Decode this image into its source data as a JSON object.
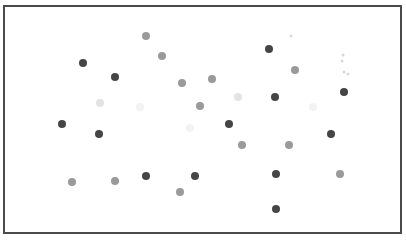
{
  "board": {
    "border_color": "#4a4a4a",
    "background": "#ffffff"
  },
  "colors": {
    "dark": "#454545",
    "mid": "#9a9a9a",
    "light": "#e3e3e3",
    "faint": "#f3f3f3"
  },
  "dots": [
    {
      "x": 146,
      "y": 36,
      "tone": "mid"
    },
    {
      "x": 162,
      "y": 56,
      "tone": "mid"
    },
    {
      "x": 83,
      "y": 63,
      "tone": "dark"
    },
    {
      "x": 115,
      "y": 77,
      "tone": "dark"
    },
    {
      "x": 182,
      "y": 83,
      "tone": "mid"
    },
    {
      "x": 212,
      "y": 79,
      "tone": "mid"
    },
    {
      "x": 100,
      "y": 103,
      "tone": "light"
    },
    {
      "x": 140,
      "y": 107,
      "tone": "faint"
    },
    {
      "x": 200,
      "y": 106,
      "tone": "mid"
    },
    {
      "x": 238,
      "y": 97,
      "tone": "light"
    },
    {
      "x": 269,
      "y": 49,
      "tone": "dark"
    },
    {
      "x": 295,
      "y": 70,
      "tone": "mid"
    },
    {
      "x": 275,
      "y": 97,
      "tone": "dark"
    },
    {
      "x": 344,
      "y": 92,
      "tone": "dark"
    },
    {
      "x": 313,
      "y": 107,
      "tone": "faint"
    },
    {
      "x": 62,
      "y": 124,
      "tone": "dark"
    },
    {
      "x": 99,
      "y": 134,
      "tone": "dark"
    },
    {
      "x": 190,
      "y": 128,
      "tone": "faint"
    },
    {
      "x": 229,
      "y": 124,
      "tone": "dark"
    },
    {
      "x": 242,
      "y": 145,
      "tone": "mid"
    },
    {
      "x": 289,
      "y": 145,
      "tone": "mid"
    },
    {
      "x": 331,
      "y": 134,
      "tone": "dark"
    },
    {
      "x": 72,
      "y": 182,
      "tone": "mid"
    },
    {
      "x": 115,
      "y": 181,
      "tone": "mid"
    },
    {
      "x": 146,
      "y": 176,
      "tone": "dark"
    },
    {
      "x": 180,
      "y": 192,
      "tone": "mid"
    },
    {
      "x": 195,
      "y": 176,
      "tone": "dark"
    },
    {
      "x": 276,
      "y": 174,
      "tone": "dark"
    },
    {
      "x": 340,
      "y": 174,
      "tone": "mid"
    },
    {
      "x": 276,
      "y": 209,
      "tone": "dark"
    }
  ],
  "specks": [
    {
      "x": 291,
      "y": 36
    },
    {
      "x": 343,
      "y": 55
    },
    {
      "x": 342,
      "y": 61
    },
    {
      "x": 344,
      "y": 72
    },
    {
      "x": 348,
      "y": 74
    }
  ]
}
